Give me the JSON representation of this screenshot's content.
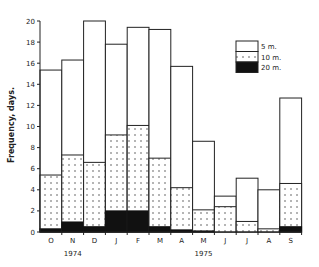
{
  "chart_data": {
    "type": "bar",
    "stacked": true,
    "title": "",
    "xlabel": "",
    "ylabel": "Frequency, days.",
    "ylim": [
      0,
      20
    ],
    "yticks": [
      0,
      2,
      4,
      6,
      8,
      10,
      12,
      14,
      16,
      18,
      20
    ],
    "grid": false,
    "legend_position": "upper right",
    "categories": [
      "O",
      "N",
      "D",
      "J",
      "F",
      "M",
      "A",
      "M",
      "J",
      "J",
      "A",
      "S"
    ],
    "year_labels": [
      {
        "label": "1974",
        "under_index": 1
      },
      {
        "label": "1975",
        "under_index": 7
      }
    ],
    "series": [
      {
        "name": "20 m.",
        "pattern": "solid-black",
        "values": [
          0.3,
          0.95,
          0.5,
          2.0,
          2.0,
          0.5,
          0.2,
          0.1,
          0.0,
          0.0,
          0.0,
          0.5
        ]
      },
      {
        "name": "10 m.",
        "pattern": "dotted",
        "values": [
          5.4,
          7.3,
          6.6,
          9.2,
          10.1,
          7.0,
          4.2,
          2.1,
          2.4,
          1.0,
          0.3,
          4.6
        ]
      },
      {
        "name": "5 m.",
        "pattern": "white",
        "values": [
          15.35,
          16.3,
          20.0,
          17.8,
          19.4,
          19.2,
          15.7,
          8.6,
          3.4,
          5.1,
          4.0,
          12.7
        ]
      }
    ],
    "note": "Values are cumulative tops (nested): 20 m. <= 10 m. <= 5 m. frequency for each month."
  }
}
